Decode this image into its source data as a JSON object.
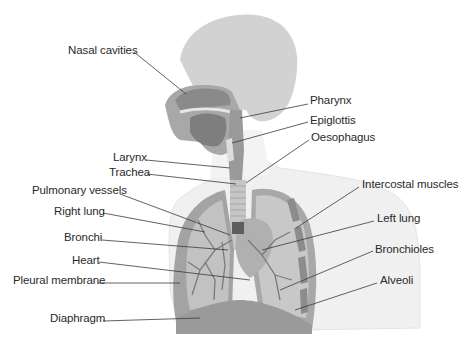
{
  "colors": {
    "body_silhouette": "#efefef",
    "head_skull": "#cfcfcf",
    "tissue_dark": "#8e8e8e",
    "tissue_mid": "#a9a9a9",
    "tissue_light": "#c4c4c4",
    "leader_line": "#3a3a3a",
    "text": "#2a2a2a"
  },
  "labels": [
    {
      "id": "nasal-cavities",
      "text": "Nasal cavities",
      "side": "left"
    },
    {
      "id": "pharynx",
      "text": "Pharynx",
      "side": "right"
    },
    {
      "id": "epiglottis",
      "text": "Epiglottis",
      "side": "right"
    },
    {
      "id": "oesophagus",
      "text": "Oesophagus",
      "side": "right"
    },
    {
      "id": "larynx",
      "text": "Larynx",
      "side": "left"
    },
    {
      "id": "trachea",
      "text": "Trachea",
      "side": "left"
    },
    {
      "id": "intercostal-muscles",
      "text": "Intercostal muscles",
      "side": "right"
    },
    {
      "id": "pulmonary-vessels",
      "text": "Pulmonary vessels",
      "side": "left"
    },
    {
      "id": "right-lung",
      "text": "Right lung",
      "side": "left"
    },
    {
      "id": "left-lung",
      "text": "Left lung",
      "side": "right"
    },
    {
      "id": "bronchi",
      "text": "Bronchi",
      "side": "left"
    },
    {
      "id": "bronchioles",
      "text": "Bronchioles",
      "side": "right"
    },
    {
      "id": "heart",
      "text": "Heart",
      "side": "left"
    },
    {
      "id": "alveoli",
      "text": "Alveoli",
      "side": "right"
    },
    {
      "id": "pleural-membrane",
      "text": "Pleural membrane",
      "side": "left"
    },
    {
      "id": "diaphragm",
      "text": "Diaphragm",
      "side": "left"
    }
  ]
}
